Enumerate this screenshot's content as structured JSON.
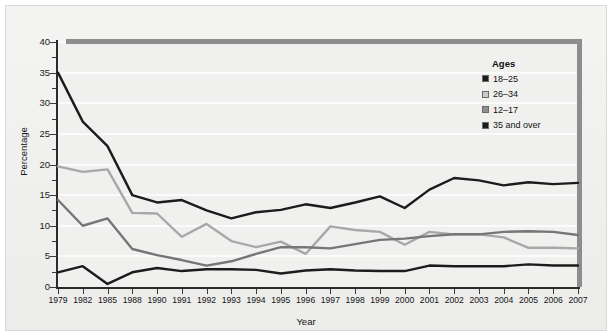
{
  "chart_data": {
    "type": "line",
    "title": "",
    "xlabel": "Year",
    "ylabel": "Percentage",
    "ylim": [
      0,
      40
    ],
    "yticks": [
      0,
      5,
      10,
      15,
      20,
      25,
      30,
      35,
      40
    ],
    "grid": true,
    "legend_position": "inside-top-right",
    "legend_title": "Ages",
    "categories": [
      "1979",
      "1982",
      "1985",
      "1988",
      "1990",
      "1991",
      "1992",
      "1993",
      "1994",
      "1995",
      "1996",
      "1997",
      "1998",
      "1999",
      "2000",
      "2001",
      "2002",
      "2003",
      "2004",
      "2005",
      "2006",
      "2007"
    ],
    "series": [
      {
        "name": "18–25",
        "color": "#1c1c1c",
        "values": [
          35.0,
          27.0,
          23.0,
          15.0,
          13.8,
          14.2,
          12.5,
          11.2,
          12.2,
          12.6,
          13.5,
          12.9,
          13.8,
          14.8,
          12.9,
          15.9,
          17.8,
          17.4,
          16.6,
          17.1,
          16.8,
          17.0
        ]
      },
      {
        "name": "26–34",
        "color": "#a8a8a8",
        "values": [
          19.7,
          18.8,
          19.2,
          12.1,
          12.0,
          8.2,
          10.3,
          7.5,
          6.5,
          7.4,
          5.4,
          9.9,
          9.3,
          9.0,
          6.9,
          9.0,
          8.6,
          8.6,
          8.1,
          6.4,
          6.4,
          6.3
        ]
      },
      {
        "name": "12–17",
        "color": "#767676",
        "values": [
          14.2,
          10.0,
          11.2,
          6.2,
          5.2,
          4.4,
          3.5,
          4.2,
          5.4,
          6.5,
          6.5,
          6.3,
          7.0,
          7.7,
          7.9,
          8.3,
          8.6,
          8.6,
          9.0,
          9.1,
          9.0,
          8.5
        ]
      },
      {
        "name": "35 and over",
        "color": "#1c1c1c",
        "values": [
          2.4,
          3.4,
          0.5,
          2.4,
          3.1,
          2.6,
          2.9,
          2.9,
          2.8,
          2.2,
          2.7,
          2.9,
          2.7,
          2.6,
          2.6,
          3.5,
          3.4,
          3.4,
          3.4,
          3.7,
          3.5,
          3.5
        ]
      }
    ]
  },
  "legend": {
    "title": "Ages",
    "entries": [
      {
        "label": "18–25",
        "swatch": "#1c1c1c"
      },
      {
        "label": "26–34",
        "swatch": "#c9c9c9"
      },
      {
        "label": "12–17",
        "swatch": "#8f8f8f"
      },
      {
        "label": "35 and over",
        "swatch": "#1c1c1c"
      }
    ]
  },
  "axes": {
    "y_title": "Percentage",
    "x_title": "Year",
    "y_ticks": [
      "0",
      "5",
      "10",
      "15",
      "20",
      "25",
      "30",
      "35",
      "40"
    ],
    "x_ticks": [
      "1979",
      "1982",
      "1985",
      "1988",
      "1990",
      "1991",
      "1992",
      "1993",
      "1994",
      "1995",
      "1996",
      "1997",
      "1998",
      "1999",
      "2000",
      "2001",
      "2002",
      "2003",
      "2004",
      "2005",
      "2006",
      "2007"
    ]
  }
}
